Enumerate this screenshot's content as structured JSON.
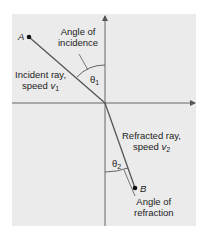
{
  "diagram": {
    "type": "refraction",
    "point_a": "A",
    "point_b": "B",
    "angle_incidence_label_line1": "Angle of",
    "angle_incidence_label_line2": "incidence",
    "theta1": "θ",
    "theta1_sub": "1",
    "incident_line1": "Incident ray,",
    "incident_line2": "speed ",
    "incident_v": "v",
    "incident_v_sub": "1",
    "refracted_line1": "Refracted ray,",
    "refracted_line2": "speed ",
    "refracted_v": "v",
    "refracted_v_sub": "2",
    "theta2": "θ",
    "theta2_sub": "2",
    "angle_refraction_label_line1": "Angle of",
    "angle_refraction_label_line2": "refraction"
  },
  "colors": {
    "panel": "#ebebeb",
    "line": "#555555",
    "text": "#222222"
  }
}
